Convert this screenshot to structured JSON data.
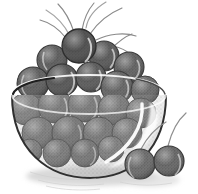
{
  "image": {
    "title": "Bowl of Cherries",
    "subject": "still life illustration of a glass bowl filled with cherries",
    "style": "grayscale halftone stipple engraving",
    "background_color": "#ffffff",
    "width": 198,
    "height": 194
  },
  "palette": {
    "background": "#ffffff",
    "cherry_fill": "#6e6e6e",
    "cherry_fill_dark": "#4a4a4a",
    "cherry_fill_light": "#8d8d8d",
    "cherry_outline": "#3c3c3c",
    "bowl_glass": "#9a9a9a",
    "bowl_outline": "#343434",
    "highlight": "#ffffff",
    "shadow": "#d8d8d8",
    "stem": "#7a7a7a"
  },
  "elements": {
    "bowl": {
      "name": "glass bowl",
      "shape": "hemispherical transparent bowl",
      "rim_label": "bowl rim ellipse",
      "highlight_label": "curved white specular highlight on right wall"
    },
    "cherry_pile": {
      "name": "pile of cherries inside bowl",
      "count_visible": 22
    },
    "loose_cherries": {
      "name": "two loose cherries resting in front of the bowl",
      "count": 2
    },
    "stems": {
      "name": "thin cherry stems arcing above the pile",
      "count": 7
    },
    "ground_shadow": {
      "name": "soft hatched shadow beneath the bowl"
    }
  },
  "cherries_in_bowl": [
    {
      "cx": 79,
      "cy": 45,
      "r": 16,
      "tone": "#4d4d4d"
    },
    {
      "cx": 52,
      "cy": 60,
      "r": 14,
      "tone": "#5a5a5a"
    },
    {
      "cx": 104,
      "cy": 56,
      "r": 14,
      "tone": "#565656"
    },
    {
      "cx": 128,
      "cy": 66,
      "r": 14,
      "tone": "#5f5f5f"
    },
    {
      "cx": 33,
      "cy": 82,
      "r": 15,
      "tone": "#5c5c5c"
    },
    {
      "cx": 62,
      "cy": 80,
      "r": 15,
      "tone": "#535353"
    },
    {
      "cx": 90,
      "cy": 76,
      "r": 14,
      "tone": "#585858"
    },
    {
      "cx": 116,
      "cy": 86,
      "r": 15,
      "tone": "#636363"
    },
    {
      "cx": 143,
      "cy": 88,
      "r": 13,
      "tone": "#6a6a6a"
    },
    {
      "cx": 26,
      "cy": 108,
      "r": 15,
      "tone": "#6d6d6d"
    },
    {
      "cx": 54,
      "cy": 105,
      "r": 16,
      "tone": "#666666"
    },
    {
      "cx": 84,
      "cy": 104,
      "r": 16,
      "tone": "#6b6b6b"
    },
    {
      "cx": 113,
      "cy": 108,
      "r": 15,
      "tone": "#707070"
    },
    {
      "cx": 140,
      "cy": 112,
      "r": 14,
      "tone": "#767676"
    },
    {
      "cx": 38,
      "cy": 132,
      "r": 15,
      "tone": "#6f6f6f"
    },
    {
      "cx": 68,
      "cy": 132,
      "r": 16,
      "tone": "#6a6a6a"
    },
    {
      "cx": 98,
      "cy": 132,
      "r": 15,
      "tone": "#717171"
    },
    {
      "cx": 126,
      "cy": 132,
      "r": 14,
      "tone": "#787878"
    },
    {
      "cx": 56,
      "cy": 152,
      "r": 13,
      "tone": "#737373"
    },
    {
      "cx": 84,
      "cy": 152,
      "r": 13,
      "tone": "#6e6e6e"
    },
    {
      "cx": 110,
      "cy": 148,
      "r": 12,
      "tone": "#7a7a7a"
    },
    {
      "cx": 30,
      "cy": 150,
      "r": 11,
      "tone": "#757575"
    }
  ],
  "cherries_loose": [
    {
      "cx": 140,
      "cy": 163,
      "r": 15,
      "tone": "#6a6a6a"
    },
    {
      "cx": 168,
      "cy": 160,
      "r": 15,
      "tone": "#646464"
    }
  ],
  "stem_paths": [
    "M74 32 C 70 20, 64 10, 58 4",
    "M82 30 C 84 18, 88 10, 94 3",
    "M90 34 C 98 22, 110 13, 122 8",
    "M96 40 C 108 34, 124 32, 136 36",
    "M100 46 C 112 44, 126 48, 134 58",
    "M66 38 C 58 28, 48 22, 40 20",
    "M110 50 C 118 42, 126 36, 132 34"
  ],
  "loose_stem_paths": [
    "M168 146 C 172 130, 178 120, 184 114",
    "M141 149 C 148 136, 156 128, 164 124"
  ]
}
